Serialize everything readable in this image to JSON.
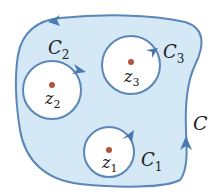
{
  "diagram": {
    "colors": {
      "region_fill": "#d4e8f5",
      "stroke": "#5b86b8",
      "arrow": "#4a78b0",
      "point": "#b5533c",
      "text": "#222222"
    },
    "outer_contour": {
      "label": "C",
      "letter": "C",
      "subscript": ""
    },
    "contours": [
      {
        "id": "c1",
        "letter": "C",
        "subscript": "1",
        "point_letter": "z",
        "point_subscript": "1"
      },
      {
        "id": "c2",
        "letter": "C",
        "subscript": "2",
        "point_letter": "z",
        "point_subscript": "2"
      },
      {
        "id": "c3",
        "letter": "C",
        "subscript": "3",
        "point_letter": "z",
        "point_subscript": "3"
      }
    ]
  }
}
